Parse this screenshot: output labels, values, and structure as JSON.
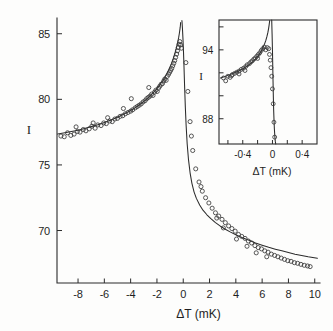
{
  "chart_data": {
    "type": "scatter",
    "title": "",
    "xlabel": "ΔT  (mK)",
    "ylabel": "I",
    "xlim": [
      -9.6,
      10.4
    ],
    "ylim": [
      66.0,
      86.2
    ],
    "xticks": [
      -8,
      -6,
      -4,
      -2,
      0,
      2,
      4,
      6,
      8,
      10
    ],
    "xtick_labels": [
      "-8",
      "-6",
      "-4",
      "-2",
      "0",
      "2",
      "4",
      "6",
      "8",
      "10"
    ],
    "yticks": [
      70,
      75,
      80,
      85
    ],
    "ytick_labels": [
      "70",
      "75",
      "80",
      "85"
    ],
    "grid": false,
    "legend": null,
    "marker": "open-circle",
    "series": [
      {
        "name": "measured intensity (left branch)",
        "marker": "open-circle",
        "points": [
          [
            -9.3,
            77.2
          ],
          [
            -9.05,
            77.15
          ],
          [
            -8.8,
            77.45
          ],
          [
            -8.55,
            77.25
          ],
          [
            -8.3,
            77.35
          ],
          [
            -8.05,
            77.55
          ],
          [
            -7.85,
            77.5
          ],
          [
            -7.6,
            77.7
          ],
          [
            -7.4,
            77.6
          ],
          [
            -7.15,
            77.75
          ],
          [
            -6.95,
            77.95
          ],
          [
            -6.7,
            77.8
          ],
          [
            -6.5,
            78.05
          ],
          [
            -6.25,
            78.0
          ],
          [
            -6.05,
            78.2
          ],
          [
            -5.85,
            78.15
          ],
          [
            -5.6,
            78.35
          ],
          [
            -5.4,
            78.3
          ],
          [
            -5.2,
            78.5
          ],
          [
            -5.0,
            78.55
          ],
          [
            -4.8,
            78.7
          ],
          [
            -4.6,
            78.75
          ],
          [
            -4.4,
            78.9
          ],
          [
            -4.2,
            79.0
          ],
          [
            -4.0,
            79.1
          ],
          [
            -3.85,
            79.2
          ],
          [
            -3.65,
            79.35
          ],
          [
            -3.5,
            79.45
          ],
          [
            -3.35,
            79.55
          ],
          [
            -3.2,
            79.65
          ],
          [
            -3.05,
            79.8
          ],
          [
            -2.9,
            79.9
          ],
          [
            -2.78,
            80.05
          ],
          [
            -2.65,
            80.15
          ],
          [
            -2.52,
            80.25
          ],
          [
            -2.4,
            80.4
          ],
          [
            -2.3,
            80.3
          ],
          [
            -2.18,
            80.55
          ],
          [
            -2.08,
            80.7
          ],
          [
            -1.98,
            80.6
          ],
          [
            -1.88,
            80.85
          ],
          [
            -1.78,
            81.0
          ],
          [
            -1.68,
            81.15
          ],
          [
            -1.58,
            81.2
          ],
          [
            -1.48,
            81.4
          ],
          [
            -1.4,
            81.55
          ],
          [
            -1.3,
            81.45
          ],
          [
            -1.22,
            81.75
          ],
          [
            -1.12,
            81.9
          ],
          [
            -1.04,
            82.05
          ],
          [
            -0.96,
            82.2
          ],
          [
            -0.88,
            82.35
          ],
          [
            -0.8,
            82.55
          ],
          [
            -0.72,
            82.75
          ],
          [
            -0.65,
            82.95
          ],
          [
            -0.58,
            83.2
          ],
          [
            -0.5,
            83.45
          ],
          [
            -0.44,
            83.7
          ],
          [
            -0.38,
            83.95
          ],
          [
            -0.32,
            84.2
          ],
          [
            -0.26,
            84.4
          ],
          [
            -0.2,
            84.15
          ],
          [
            -2.62,
            80.9
          ],
          [
            -3.95,
            80.05
          ],
          [
            -4.55,
            79.3
          ],
          [
            -5.75,
            78.6
          ],
          [
            -6.85,
            78.2
          ],
          [
            -8.15,
            77.9
          ],
          [
            -0.14,
            83.9
          ]
        ]
      },
      {
        "name": "measured intensity (right branch)",
        "marker": "open-circle",
        "points": [
          [
            0.2,
            82.8
          ],
          [
            0.35,
            80.6
          ],
          [
            0.52,
            78.3
          ],
          [
            0.72,
            76.1
          ],
          [
            0.95,
            74.7
          ],
          [
            1.2,
            73.7
          ],
          [
            1.45,
            73.0
          ],
          [
            1.7,
            72.5
          ],
          [
            1.95,
            72.1
          ],
          [
            2.2,
            71.7
          ],
          [
            2.45,
            71.35
          ],
          [
            2.7,
            71.1
          ],
          [
            2.95,
            70.85
          ],
          [
            3.2,
            70.6
          ],
          [
            3.45,
            70.35
          ],
          [
            3.7,
            70.15
          ],
          [
            3.95,
            69.95
          ],
          [
            4.2,
            69.7
          ],
          [
            4.45,
            69.55
          ],
          [
            4.7,
            69.4
          ],
          [
            4.95,
            69.2
          ],
          [
            5.2,
            69.05
          ],
          [
            5.45,
            68.85
          ],
          [
            5.7,
            68.7
          ],
          [
            5.95,
            68.6
          ],
          [
            6.2,
            68.45
          ],
          [
            6.45,
            68.35
          ],
          [
            6.7,
            68.2
          ],
          [
            6.95,
            68.1
          ],
          [
            7.2,
            68.0
          ],
          [
            7.45,
            67.9
          ],
          [
            7.7,
            67.8
          ],
          [
            7.95,
            67.7
          ],
          [
            8.2,
            67.65
          ],
          [
            8.45,
            67.55
          ],
          [
            8.7,
            67.5
          ],
          [
            8.95,
            67.42
          ],
          [
            9.2,
            67.35
          ],
          [
            9.45,
            67.3
          ],
          [
            9.65,
            67.25
          ],
          [
            3.05,
            70.2
          ],
          [
            4.05,
            69.35
          ],
          [
            4.85,
            68.8
          ],
          [
            5.55,
            68.3
          ],
          [
            6.35,
            68.0
          ],
          [
            2.55,
            70.95
          ],
          [
            1.35,
            73.35
          ],
          [
            0.62,
            77.2
          ]
        ]
      }
    ],
    "theory_curves": [
      {
        "name": "theory (T < Tc branch)",
        "points": [
          [
            -9.55,
            77.35
          ],
          [
            -9.0,
            77.45
          ],
          [
            -8.5,
            77.55
          ],
          [
            -8.0,
            77.65
          ],
          [
            -7.5,
            77.78
          ],
          [
            -7.0,
            77.92
          ],
          [
            -6.5,
            78.07
          ],
          [
            -6.0,
            78.24
          ],
          [
            -5.5,
            78.43
          ],
          [
            -5.0,
            78.64
          ],
          [
            -4.5,
            78.88
          ],
          [
            -4.0,
            79.15
          ],
          [
            -3.6,
            79.4
          ],
          [
            -3.2,
            79.68
          ],
          [
            -2.8,
            80.0
          ],
          [
            -2.4,
            80.38
          ],
          [
            -2.1,
            80.7
          ],
          [
            -1.8,
            81.08
          ],
          [
            -1.55,
            81.44
          ],
          [
            -1.3,
            81.86
          ],
          [
            -1.1,
            82.26
          ],
          [
            -0.9,
            82.72
          ],
          [
            -0.75,
            83.13
          ],
          [
            -0.62,
            83.55
          ],
          [
            -0.5,
            84.0
          ],
          [
            -0.42,
            84.35
          ],
          [
            -0.35,
            84.7
          ],
          [
            -0.3,
            85.0
          ],
          [
            -0.26,
            85.28
          ],
          [
            -0.23,
            85.5
          ],
          [
            -0.21,
            85.7
          ],
          [
            -0.2,
            85.85
          ]
        ]
      },
      {
        "name": "theory (T > Tc branch)",
        "points": [
          [
            -0.1,
            86.0
          ],
          [
            -0.06,
            85.4
          ],
          [
            -0.02,
            84.6
          ],
          [
            0.02,
            83.6
          ],
          [
            0.06,
            82.4
          ],
          [
            0.1,
            81.1
          ],
          [
            0.16,
            79.4
          ],
          [
            0.22,
            78.0
          ],
          [
            0.3,
            76.6
          ],
          [
            0.4,
            75.4
          ],
          [
            0.52,
            74.4
          ],
          [
            0.66,
            73.6
          ],
          [
            0.82,
            72.95
          ],
          [
            1.0,
            72.45
          ],
          [
            1.25,
            71.95
          ],
          [
            1.5,
            71.55
          ],
          [
            1.8,
            71.2
          ],
          [
            2.1,
            70.9
          ],
          [
            2.45,
            70.6
          ],
          [
            2.8,
            70.35
          ],
          [
            3.2,
            70.1
          ],
          [
            3.6,
            69.88
          ],
          [
            4.0,
            69.68
          ],
          [
            4.5,
            69.45
          ],
          [
            5.0,
            69.25
          ],
          [
            5.5,
            69.05
          ],
          [
            6.0,
            68.88
          ],
          [
            6.5,
            68.72
          ],
          [
            7.0,
            68.58
          ],
          [
            7.5,
            68.45
          ],
          [
            8.0,
            68.32
          ],
          [
            8.5,
            68.2
          ],
          [
            9.0,
            68.1
          ],
          [
            9.5,
            68.0
          ],
          [
            10.2,
            67.88
          ]
        ]
      }
    ],
    "inset": {
      "type": "scatter",
      "xlabel": "ΔT  (mK)",
      "ylabel": "I",
      "xlim": [
        -0.72,
        0.6
      ],
      "ylim": [
        85.8,
        96.6
      ],
      "xticks": [
        -0.6,
        -0.4,
        -0.2,
        0.0,
        0.2,
        0.4
      ],
      "xtick_labels": [
        "",
        "-0·4",
        "",
        "0",
        "",
        "0·4"
      ],
      "yticks": [
        88,
        90,
        92,
        94,
        96
      ],
      "ytick_labels": [
        "88",
        "",
        "",
        "94",
        ""
      ],
      "marker": "open-circle",
      "series": [
        {
          "name": "measured intensity (inset)",
          "marker": "open-circle",
          "points": [
            [
              -0.66,
              91.55
            ],
            [
              -0.63,
              91.3
            ],
            [
              -0.6,
              91.7
            ],
            [
              -0.57,
              91.6
            ],
            [
              -0.54,
              91.85
            ],
            [
              -0.51,
              91.95
            ],
            [
              -0.48,
              92.05
            ],
            [
              -0.45,
              92.15
            ],
            [
              -0.42,
              92.3
            ],
            [
              -0.39,
              92.4
            ],
            [
              -0.36,
              92.55
            ],
            [
              -0.34,
              92.7
            ],
            [
              -0.31,
              92.8
            ],
            [
              -0.29,
              92.95
            ],
            [
              -0.27,
              93.05
            ],
            [
              -0.25,
              93.2
            ],
            [
              -0.23,
              93.3
            ],
            [
              -0.21,
              93.45
            ],
            [
              -0.19,
              93.6
            ],
            [
              -0.17,
              93.75
            ],
            [
              -0.15,
              93.95
            ],
            [
              -0.13,
              94.1
            ],
            [
              -0.11,
              94.25
            ],
            [
              -0.09,
              94.0
            ],
            [
              -0.07,
              94.2
            ],
            [
              -0.05,
              94.1
            ],
            [
              -0.04,
              93.6
            ],
            [
              -0.03,
              93.1
            ],
            [
              -0.02,
              92.45
            ],
            [
              -0.01,
              91.7
            ],
            [
              0.0,
              90.6
            ],
            [
              0.01,
              89.3
            ],
            [
              0.02,
              87.7
            ],
            [
              0.03,
              86.4
            ],
            [
              -0.37,
              92.2
            ],
            [
              -0.45,
              91.9
            ],
            [
              -0.55,
              91.75
            ],
            [
              -0.2,
              93.25
            ]
          ]
        }
      ],
      "theory_curves": [
        {
          "name": "theory (inset, T < Tc)",
          "points": [
            [
              -0.7,
              91.55
            ],
            [
              -0.64,
              91.68
            ],
            [
              -0.58,
              91.82
            ],
            [
              -0.52,
              91.98
            ],
            [
              -0.46,
              92.15
            ],
            [
              -0.4,
              92.35
            ],
            [
              -0.35,
              92.55
            ],
            [
              -0.3,
              92.78
            ],
            [
              -0.26,
              93.0
            ],
            [
              -0.22,
              93.25
            ],
            [
              -0.19,
              93.5
            ],
            [
              -0.16,
              93.8
            ],
            [
              -0.13,
              94.15
            ],
            [
              -0.11,
              94.45
            ],
            [
              -0.09,
              94.8
            ],
            [
              -0.075,
              95.15
            ],
            [
              -0.062,
              95.5
            ],
            [
              -0.052,
              95.85
            ],
            [
              -0.045,
              96.15
            ],
            [
              -0.04,
              96.4
            ],
            [
              -0.037,
              96.55
            ]
          ]
        },
        {
          "name": "theory (inset, T > Tc)",
          "points": [
            [
              -0.01,
              96.6
            ],
            [
              -0.005,
              95.4
            ],
            [
              0.0,
              94.0
            ],
            [
              0.004,
              92.6
            ],
            [
              0.008,
              91.2
            ],
            [
              0.012,
              89.9
            ],
            [
              0.016,
              88.8
            ],
            [
              0.021,
              87.9
            ],
            [
              0.026,
              87.1
            ],
            [
              0.032,
              86.5
            ],
            [
              0.038,
              86.05
            ],
            [
              0.044,
              85.8
            ]
          ]
        }
      ]
    }
  },
  "labels": {
    "x_axis_title": "ΔT  (mK)",
    "y_axis_title": "I",
    "inset_x_axis_title": "ΔT  (mK)",
    "inset_y_axis_title": "I",
    "xtick_0": "-8",
    "xtick_1": "-6",
    "xtick_2": "-4",
    "xtick_3": "-2",
    "xtick_4": "0",
    "xtick_5": "2",
    "xtick_6": "4",
    "xtick_7": "6",
    "xtick_8": "8",
    "xtick_9": "10",
    "ytick_0": "70",
    "ytick_1": "75",
    "ytick_2": "80",
    "ytick_3": "85",
    "inset_xtick_0": "-0·4",
    "inset_xtick_1": "0",
    "inset_xtick_2": "0·4",
    "inset_ytick_0": "88",
    "inset_ytick_1": "94"
  },
  "colors": {
    "background": "#fdfdfc",
    "ink": "#2b2b2b",
    "marker_stroke": "#3a3a3a"
  }
}
